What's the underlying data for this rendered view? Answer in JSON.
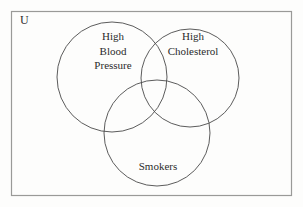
{
  "diagram": {
    "type": "venn",
    "universe": {
      "label": "U",
      "name": "universal-set"
    },
    "sets": [
      {
        "id": "high-blood-pressure",
        "label": "High\nBlood\nPressure",
        "label_lines": [
          "High",
          "Blood",
          "Pressure"
        ],
        "position": "left",
        "center": {
          "x": 112,
          "y": 77
        },
        "radius": 55
      },
      {
        "id": "high-cholesterol",
        "label": "High\nCholesterol",
        "label_lines": [
          "High",
          "Cholesterol"
        ],
        "position": "right",
        "center": {
          "x": 190,
          "y": 78
        },
        "radius": 49
      },
      {
        "id": "smokers",
        "label": "Smokers",
        "label_lines": [
          "Smokers"
        ],
        "position": "bottom",
        "center": {
          "x": 157,
          "y": 133
        },
        "radius": 53
      }
    ],
    "frame": {
      "x": 11,
      "y": 11,
      "width": 281,
      "height": 185
    },
    "colors": {
      "stroke": "#4a4a4a",
      "frame_stroke": "#9a9a98",
      "text": "#2b2b2b",
      "background": "#fdfdfc"
    }
  }
}
